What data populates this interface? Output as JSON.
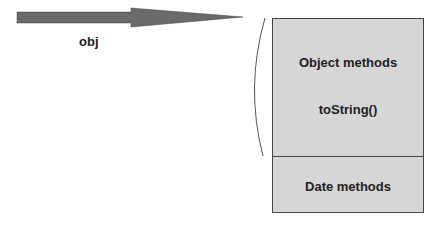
{
  "arrow": {
    "label": "obj",
    "color": "#6a6a6a"
  },
  "object_box": {
    "top_section": [
      "Object methods",
      "toString()"
    ],
    "bottom_section": "Date methods",
    "fill": "#d6d6d6"
  }
}
